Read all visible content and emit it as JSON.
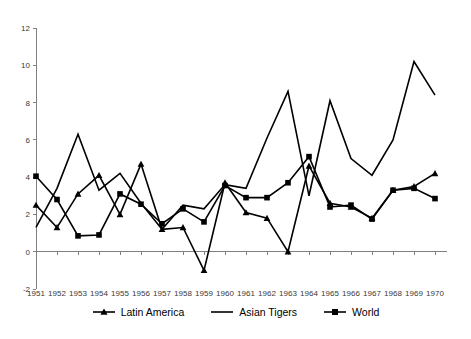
{
  "chart_data": {
    "type": "line",
    "title": "",
    "subtitle": "",
    "xlabel": "",
    "ylabel": "",
    "grid": false,
    "legend_position": "bottom",
    "xlim": [
      1951,
      1970
    ],
    "ylim": [
      -2,
      12
    ],
    "ytick_values": [
      -2,
      0,
      2,
      4,
      6,
      8,
      10,
      12
    ],
    "ytick_labels": [
      "-2",
      "0",
      "2",
      "4",
      "6",
      "8",
      "10",
      "12"
    ],
    "categories": [
      1951,
      1952,
      1953,
      1954,
      1955,
      1956,
      1957,
      1958,
      1959,
      1960,
      1961,
      1962,
      1963,
      1964,
      1965,
      1966,
      1967,
      1968,
      1969,
      1970
    ],
    "xtick_labels": [
      "1951",
      "1952",
      "1953",
      "1954",
      "1955",
      "1956",
      "1957",
      "1958",
      "1959",
      "1960",
      "1961",
      "1962",
      "1963",
      "1964",
      "1965",
      "1966",
      "1967",
      "1968",
      "1969",
      "1970"
    ],
    "series": [
      {
        "name": "Latin America",
        "marker": "triangle",
        "values": [
          2.5,
          1.3,
          3.1,
          4.1,
          2.0,
          4.7,
          1.2,
          1.3,
          -1.0,
          3.7,
          2.1,
          1.8,
          0.0,
          4.6,
          2.6,
          2.4,
          1.8,
          3.3,
          3.5,
          4.2
        ]
      },
      {
        "name": "Asian Tigers",
        "marker": "none",
        "values": [
          1.3,
          3.4,
          6.3,
          3.3,
          4.2,
          2.6,
          1.2,
          2.5,
          2.3,
          3.6,
          3.4,
          6.1,
          8.6,
          3.0,
          8.1,
          5.0,
          4.1,
          6.0,
          10.2,
          8.4
        ]
      },
      {
        "name": "World",
        "marker": "square",
        "values": [
          4.05,
          2.8,
          0.85,
          0.9,
          3.1,
          2.55,
          1.5,
          2.3,
          1.6,
          3.55,
          2.9,
          2.9,
          3.7,
          5.1,
          2.4,
          2.5,
          1.75,
          3.3,
          3.4,
          2.85
        ]
      }
    ]
  },
  "legend": {
    "items": [
      {
        "label": "Latin America",
        "marker": "triangle"
      },
      {
        "label": "Asian Tigers",
        "marker": "line"
      },
      {
        "label": "World",
        "marker": "square"
      }
    ]
  }
}
